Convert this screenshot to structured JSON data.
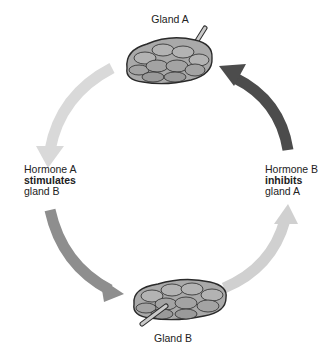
{
  "diagram": {
    "type": "feedback-loop",
    "nodes": [
      {
        "id": "gland_a",
        "label": "Gland A"
      },
      {
        "id": "gland_b",
        "label": "Gland B"
      }
    ],
    "edges": [
      {
        "from": "gland_a",
        "to": "gland_b",
        "line1": "Hormone A",
        "line2": "stimulates",
        "line3": "gland B",
        "color": "#8a8a8a"
      },
      {
        "from": "gland_b",
        "to": "gland_a",
        "line1": "Hormone B",
        "line2": "inhibits",
        "line3": "gland A",
        "color": "#4a4a4a"
      }
    ],
    "colors": {
      "arrow_light": "#d8d8d8",
      "arrow_medium": "#8e8e8e",
      "arrow_dark": "#4c4c4c",
      "arrow_pale": "#cfcfcf",
      "gland_fill": "#a9a9a9",
      "gland_stroke": "#2a2a2a"
    }
  }
}
